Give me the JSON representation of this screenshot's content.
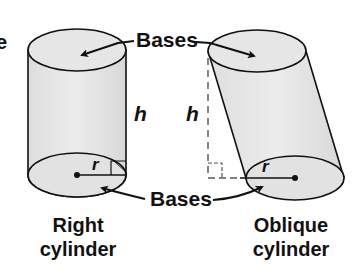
{
  "diagram": {
    "partial_left_text": "e",
    "top_label": "Bases",
    "bottom_label": "Bases",
    "right_cylinder": {
      "height_label": "h",
      "radius_label": "r",
      "caption_line1": "Right",
      "caption_line2": "cylinder"
    },
    "oblique_cylinder": {
      "height_label": "h",
      "radius_label": "r",
      "caption_line1": "Oblique",
      "caption_line2": "cylinder"
    },
    "colors": {
      "fill": "#e4e4e4",
      "stroke": "#111111",
      "dashed": "#555555"
    }
  }
}
